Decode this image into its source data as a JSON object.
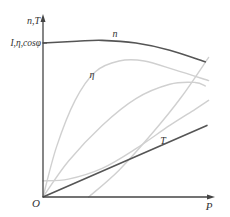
{
  "chart_data": {
    "type": "line",
    "title": "",
    "xlabel": "P",
    "ylabel_top": "n,T",
    "ylabel_secondary": "I,η,cosφ",
    "origin_label": "O",
    "xlim": [
      0,
      1
    ],
    "ylim": [
      0,
      1
    ],
    "grid": false,
    "legend": "none",
    "colors": {
      "axis": "#444444",
      "dark_curve": "#555555",
      "light_curve": "#d0d0d0"
    },
    "series": [
      {
        "name": "n",
        "label": "n",
        "style": "dark",
        "points": [
          [
            0,
            0.86
          ],
          [
            0.2,
            0.87
          ],
          [
            0.35,
            0.875
          ],
          [
            0.55,
            0.86
          ],
          [
            0.75,
            0.82
          ],
          [
            0.96,
            0.755
          ]
        ]
      },
      {
        "name": "T",
        "label": "T",
        "style": "dark",
        "points": [
          [
            0,
            0
          ],
          [
            0.97,
            0.4
          ]
        ]
      },
      {
        "name": "eta",
        "label": "η",
        "style": "light",
        "points": [
          [
            0,
            0
          ],
          [
            0.08,
            0.28
          ],
          [
            0.19,
            0.54
          ],
          [
            0.31,
            0.7
          ],
          [
            0.45,
            0.76
          ],
          [
            0.6,
            0.76
          ],
          [
            0.78,
            0.71
          ],
          [
            0.98,
            0.65
          ]
        ]
      },
      {
        "name": "cosphi",
        "label": "",
        "style": "light",
        "points": [
          [
            0,
            0
          ],
          [
            0.15,
            0.2
          ],
          [
            0.35,
            0.4
          ],
          [
            0.55,
            0.55
          ],
          [
            0.75,
            0.63
          ],
          [
            0.9,
            0.64
          ],
          [
            0.96,
            0.62
          ]
        ]
      },
      {
        "name": "I",
        "label": "",
        "style": "light",
        "points": [
          [
            0,
            0.09
          ],
          [
            0.15,
            0.1
          ],
          [
            0.35,
            0.16
          ],
          [
            0.55,
            0.27
          ],
          [
            0.75,
            0.4
          ],
          [
            0.9,
            0.49
          ],
          [
            0.98,
            0.54
          ]
        ]
      },
      {
        "name": "P1",
        "label": "",
        "style": "light",
        "points": [
          [
            0.27,
            0
          ],
          [
            0.45,
            0.15
          ],
          [
            0.65,
            0.36
          ],
          [
            0.82,
            0.56
          ],
          [
            0.98,
            0.78
          ]
        ]
      }
    ]
  }
}
